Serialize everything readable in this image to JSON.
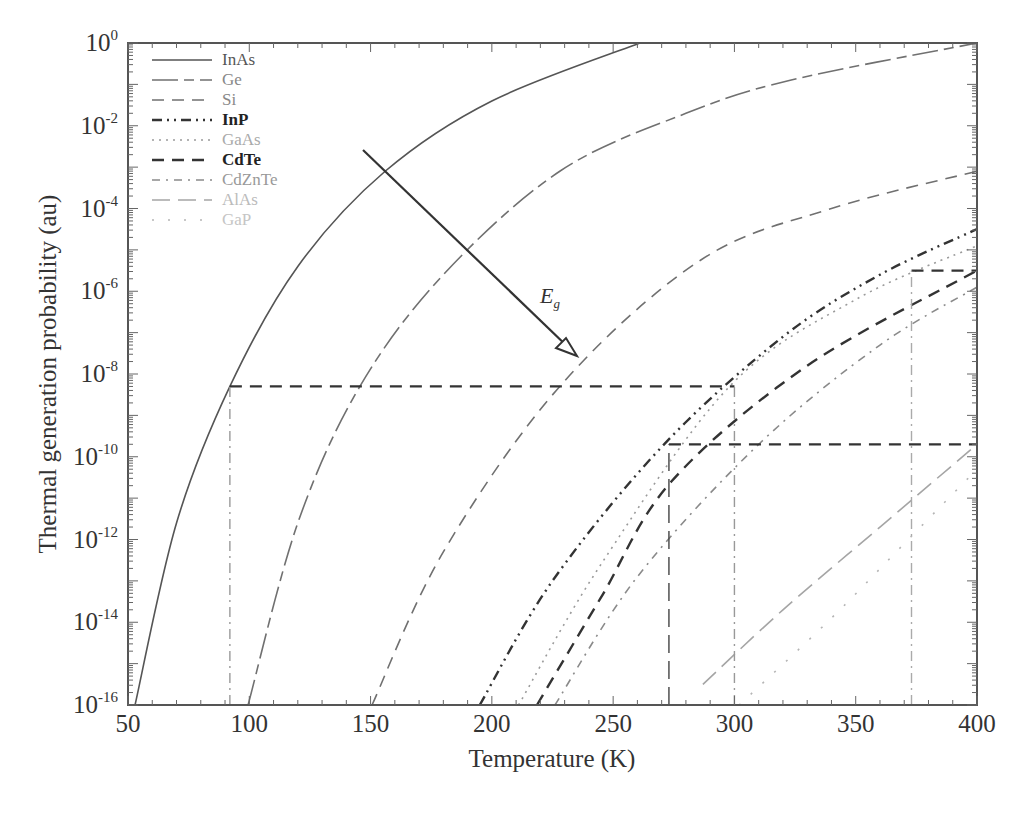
{
  "chart_data": {
    "type": "line",
    "title": "",
    "xlabel": "Temperature (K)",
    "ylabel": "Thermal generation probability (au)",
    "xlim": [
      50,
      400
    ],
    "ylim_log10": [
      -16,
      0
    ],
    "yscale": "log",
    "xticks": [
      "50",
      "100",
      "150",
      "200",
      "250",
      "300",
      "350",
      "400"
    ],
    "yticks": [
      {
        "base": "10",
        "exp": "0"
      },
      {
        "base": "10",
        "exp": "-2"
      },
      {
        "base": "10",
        "exp": "-4"
      },
      {
        "base": "10",
        "exp": "-6"
      },
      {
        "base": "10",
        "exp": "-8"
      },
      {
        "base": "10",
        "exp": "-10"
      },
      {
        "base": "10",
        "exp": "-12"
      },
      {
        "base": "10",
        "exp": "-14"
      },
      {
        "base": "10",
        "exp": "-16"
      }
    ],
    "grid": false,
    "legend_position": "upper-left",
    "series": [
      {
        "name": "InAs",
        "style": "solid",
        "color": "#555555",
        "points_log10": [
          [
            52.9,
            -16
          ],
          [
            70,
            -11.6
          ],
          [
            92,
            -8.3
          ],
          [
            120,
            -5.4
          ],
          [
            156,
            -3.1
          ],
          [
            200,
            -1.4
          ],
          [
            261,
            0
          ]
        ]
      },
      {
        "name": "Ge",
        "style": "longdash-dash",
        "color": "#707070",
        "points_log10": [
          [
            99.5,
            -16
          ],
          [
            120,
            -11.6
          ],
          [
            145.6,
            -8.3
          ],
          [
            180,
            -5.6
          ],
          [
            228,
            -3.1
          ],
          [
            280,
            -1.7
          ],
          [
            323,
            -0.9
          ],
          [
            400,
            0
          ]
        ]
      },
      {
        "name": "Si",
        "style": "dash",
        "color": "#707070",
        "points_log10": [
          [
            150.6,
            -16
          ],
          [
            180,
            -12.3
          ],
          [
            228,
            -8.3
          ],
          [
            286,
            -5.25
          ],
          [
            340,
            -4.0
          ],
          [
            400,
            -3.1
          ]
        ]
      },
      {
        "name": "InP",
        "style": "dash-dot-dot",
        "color": "#333333",
        "points_log10": [
          [
            195,
            -16
          ],
          [
            225,
            -13.0
          ],
          [
            271,
            -9.7
          ],
          [
            320,
            -7.1
          ],
          [
            360,
            -5.6
          ],
          [
            400,
            -4.5
          ]
        ]
      },
      {
        "name": "GaAs",
        "style": "dotted",
        "color": "#9a9a9a",
        "points_log10": [
          [
            211,
            -16
          ],
          [
            245,
            -12.6
          ],
          [
            298,
            -8.3
          ],
          [
            350,
            -6.2
          ],
          [
            400,
            -4.9
          ]
        ]
      },
      {
        "name": "CdTe",
        "style": "dash",
        "color": "#333333",
        "points_log10": [
          [
            218.6,
            -16
          ],
          [
            245,
            -13.4
          ],
          [
            274,
            -10.6
          ],
          [
            330,
            -7.8
          ],
          [
            400,
            -5.5
          ]
        ]
      },
      {
        "name": "CdZnTe",
        "style": "dash-dot",
        "color": "#8a8a8a",
        "points_log10": [
          [
            226,
            -16
          ],
          [
            260,
            -12.9
          ],
          [
            310,
            -9.7
          ],
          [
            360,
            -7.3
          ],
          [
            400,
            -5.9
          ]
        ]
      },
      {
        "name": "AlAs",
        "style": "longdash",
        "color": "#a5a5a5",
        "points_log10": [
          [
            287,
            -15.5
          ],
          [
            320,
            -13.7
          ],
          [
            360,
            -11.7
          ],
          [
            400,
            -9.7
          ]
        ]
      },
      {
        "name": "GaP",
        "style": "dotted-sparse",
        "color": "#b5b5b5",
        "points_log10": [
          [
            302,
            -16
          ],
          [
            340,
            -13.9
          ],
          [
            370,
            -12.1
          ],
          [
            400,
            -10.3
          ]
        ]
      }
    ],
    "reference_lines": [
      {
        "type": "horizontal",
        "log10": -8.3,
        "x_from": 92,
        "x_to": 300,
        "style": "dash",
        "color": "#333333"
      },
      {
        "type": "vertical",
        "x": 92,
        "log10_from": -16,
        "log10_to": -8.3,
        "style": "dashdot",
        "color": "#999999"
      },
      {
        "type": "vertical",
        "x": 300,
        "log10_from": -16,
        "log10_to": -8.3,
        "style": "dashdot",
        "color": "#999999"
      },
      {
        "type": "horizontal",
        "log10": -9.7,
        "x_from": 273,
        "x_to": 400,
        "style": "dash",
        "color": "#333333"
      },
      {
        "type": "vertical",
        "x": 273,
        "log10_from": -16,
        "log10_to": -9.7,
        "style": "longdash",
        "color": "#444444"
      },
      {
        "type": "horizontal",
        "log10": -5.5,
        "x_from": 373,
        "x_to": 400,
        "style": "dash",
        "color": "#333333"
      },
      {
        "type": "vertical",
        "x": 373,
        "log10_from": -16,
        "log10_to": -5.5,
        "style": "dashdot",
        "color": "#aaaaaa"
      }
    ],
    "annotations": [
      {
        "text": "E",
        "subscript": "g",
        "type": "arrow",
        "from": [
          145,
          -2.6
        ],
        "to": [
          233,
          -7.6
        ],
        "description": "arrow indicating increasing band gap"
      }
    ]
  },
  "legend": {
    "items": [
      "InAs",
      "Ge",
      "Si",
      "InP",
      "GaAs",
      "CdTe",
      "CdZnTe",
      "AlAs",
      "GaP"
    ]
  },
  "annotation": {
    "main": "E",
    "sub": "g"
  }
}
